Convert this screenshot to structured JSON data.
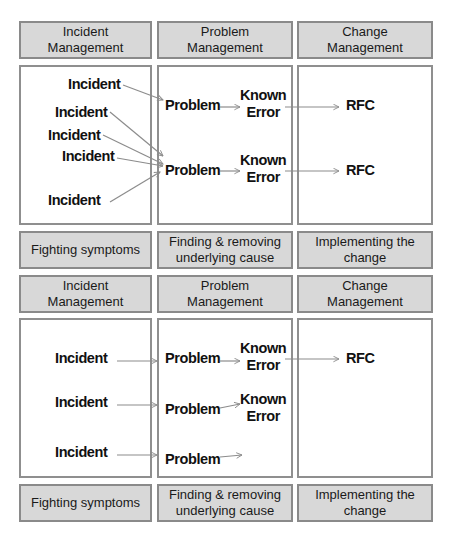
{
  "diagrams": [
    {
      "headers": [
        {
          "line1": "Incident",
          "line2": "Management"
        },
        {
          "line1": "Problem",
          "line2": "Management"
        },
        {
          "line1": "Change",
          "line2": "Management"
        }
      ],
      "incidents": [
        "Incident",
        "Incident",
        "Incident",
        "Incident",
        "Incident"
      ],
      "problems": [
        "Problem",
        "Problem"
      ],
      "known_errors": [
        {
          "line1": "Known",
          "line2": "Error"
        },
        {
          "line1": "Known",
          "line2": "Error"
        }
      ],
      "rfcs": [
        "RFC",
        "RFC"
      ],
      "footers": [
        {
          "line1": "Fighting symptoms",
          "line2": ""
        },
        {
          "line1": "Finding & removing",
          "line2": "underlying cause"
        },
        {
          "line1": "Implementing the",
          "line2": "change"
        }
      ]
    },
    {
      "headers": [
        {
          "line1": "Incident",
          "line2": "Management"
        },
        {
          "line1": "Problem",
          "line2": "Management"
        },
        {
          "line1": "Change",
          "line2": "Management"
        }
      ],
      "incidents": [
        "Incident",
        "Incident",
        "Incident"
      ],
      "problems": [
        "Problem",
        "Problem",
        "Problem"
      ],
      "known_errors": [
        {
          "line1": "Known",
          "line2": "Error"
        },
        {
          "line1": "Known",
          "line2": "Error"
        }
      ],
      "rfcs": [
        "RFC"
      ],
      "footers": [
        {
          "line1": "Fighting symptoms",
          "line2": ""
        },
        {
          "line1": "Finding & removing",
          "line2": "underlying cause"
        },
        {
          "line1": "Implementing the",
          "line2": "change"
        }
      ]
    }
  ],
  "colors": {
    "header_fill": "#d8d8d8",
    "border": "#8a8a8a",
    "arrow": "#8c8c8c"
  }
}
